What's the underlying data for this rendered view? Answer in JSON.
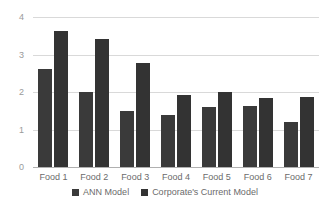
{
  "chart_data": {
    "type": "bar",
    "title": "",
    "subtitle": "",
    "xlabel": "",
    "ylabel": "",
    "categories": [
      "Food 1",
      "Food 2",
      "Food 3",
      "Food 4",
      "Food 5",
      "Food 6",
      "Food 7"
    ],
    "series": [
      {
        "name": "ANN Model",
        "color": "#3a3a3a",
        "values": [
          2.62,
          2.0,
          1.5,
          1.4,
          1.6,
          1.63,
          1.2
        ]
      },
      {
        "name": "Corporate's Current Model",
        "color": "#333333",
        "values": [
          3.63,
          3.41,
          2.78,
          1.93,
          2.01,
          1.83,
          1.87
        ]
      }
    ],
    "ylim": [
      0,
      4
    ],
    "yticks": [
      0,
      1,
      2,
      3,
      4
    ],
    "ytick_labels": [
      "0",
      "1",
      "2",
      "3",
      "4"
    ],
    "grid": true,
    "legend_position": "bottom"
  },
  "axis": {
    "y_tick_labels": [
      "4",
      "3",
      "2",
      "1",
      "0"
    ]
  },
  "legend": {
    "items": [
      {
        "label": "ANN Model",
        "color": "#3a3a3a"
      },
      {
        "label": "Corporate's Current Model",
        "color": "#333333"
      }
    ]
  },
  "colors": {
    "gridline": "#d9d9d9",
    "baseline": "#b0b0b0",
    "tick_text": "#9a9a9a",
    "category_text": "#6b6b6b",
    "background": "#ffffff"
  }
}
